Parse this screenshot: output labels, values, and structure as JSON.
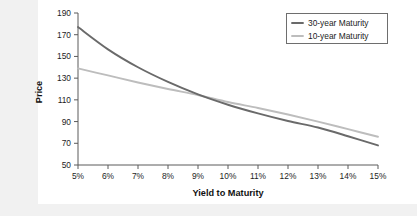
{
  "chart_data": {
    "type": "line",
    "title": "",
    "xlabel": "Yield to Maturity",
    "ylabel": "Price",
    "xlim": [
      5,
      15
    ],
    "ylim": [
      50,
      190
    ],
    "grid": false,
    "legend_position": "top-right",
    "x": [
      5,
      6,
      7,
      8,
      9,
      10,
      11,
      12,
      13,
      14,
      15
    ],
    "xtick_labels": [
      "5%",
      "6%",
      "7%",
      "8%",
      "9%",
      "10%",
      "11%",
      "12%",
      "13%",
      "14%",
      "15%"
    ],
    "ytick_labels": [
      "190",
      "170",
      "150",
      "130",
      "110",
      "90",
      "70",
      "50"
    ],
    "ytick_values": [
      190,
      170,
      150,
      130,
      110,
      90,
      70,
      50
    ],
    "series": [
      {
        "name": "30-year Maturity",
        "color": "#6a6a6a",
        "width": 1.9,
        "values": [
          177.0,
          156.5,
          140.0,
          126.5,
          115.0,
          105.5,
          97.5,
          90.5,
          84.5,
          76.5,
          68.0
        ]
      },
      {
        "name": "10-year Maturity",
        "color": "#bdbdbd",
        "width": 1.9,
        "values": [
          139.0,
          132.5,
          126.0,
          120.0,
          114.5,
          108.0,
          102.5,
          96.5,
          90.0,
          83.0,
          76.0
        ]
      }
    ]
  },
  "legend": {
    "entries": [
      {
        "label": "30-year Maturity",
        "color": "#6a6a6a"
      },
      {
        "label": "10-year Maturity",
        "color": "#bdbdbd"
      }
    ]
  },
  "axes": {
    "y_title": "Price",
    "x_title": "Yield to Maturity"
  }
}
